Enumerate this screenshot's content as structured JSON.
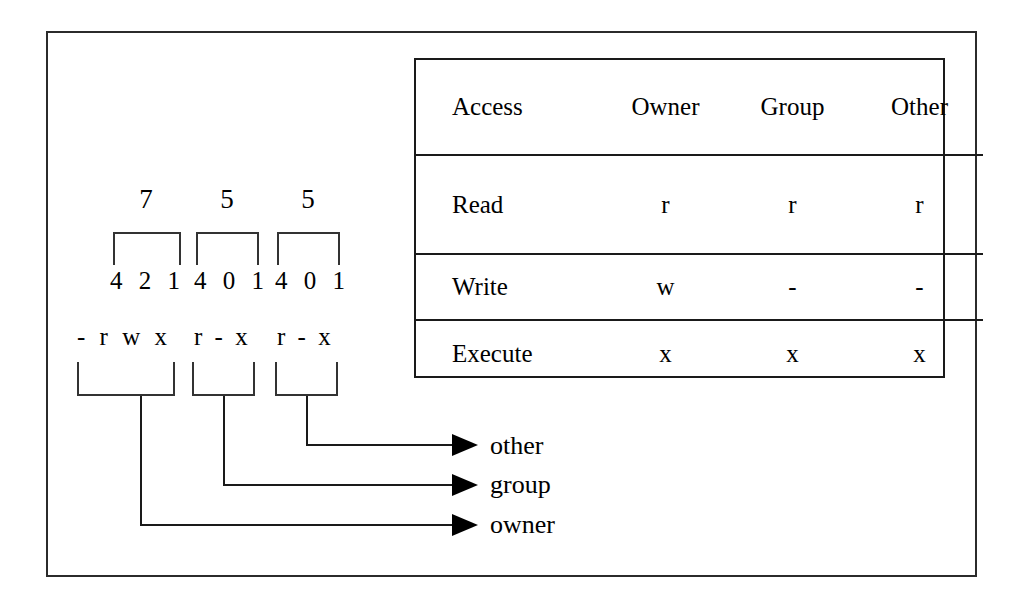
{
  "diagram": {
    "octal_values": [
      "7",
      "5",
      "5"
    ],
    "bit_weights": [
      "4 2 1",
      "4 0 1",
      "4 0 1"
    ],
    "symbolic": {
      "owner": "- r w x",
      "group": "r - x",
      "other": "r - x"
    },
    "targets": [
      {
        "label": "other"
      },
      {
        "label": "group"
      },
      {
        "label": "owner"
      }
    ]
  },
  "table": {
    "headers": [
      "Access",
      "Owner",
      "Group",
      "Other"
    ],
    "rows": [
      {
        "access": "Read",
        "owner": "r",
        "group": "r",
        "other": "r"
      },
      {
        "access": "Write",
        "owner": "w",
        "group": "-",
        "other": "-"
      },
      {
        "access": "Execute",
        "owner": "x",
        "group": "x",
        "other": "x"
      }
    ]
  },
  "colors": {
    "background": "#ffffff",
    "ink": "#000000",
    "frame": "#2b2b2b",
    "rule": "#1a1a1a"
  }
}
